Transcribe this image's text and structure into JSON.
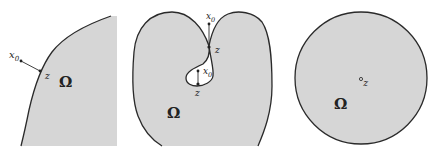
{
  "colors": {
    "fill": "#d6d6d6",
    "stroke": "#2a2a2a",
    "background": "#ffffff"
  },
  "panels": [
    {
      "name": "left-panel",
      "domain_label": "Ω",
      "point_outside": {
        "label": "x",
        "subscript": "0"
      },
      "boundary_point": {
        "label": "z"
      }
    },
    {
      "name": "middle-panel",
      "domain_label": "Ω",
      "points": [
        {
          "label": "x",
          "subscript": "0",
          "role": "exterior-above"
        },
        {
          "label": "z",
          "role": "boundary-neck"
        },
        {
          "label": "x",
          "subscript": "0",
          "role": "in-hole"
        },
        {
          "label": "z",
          "role": "boundary-hole"
        }
      ]
    },
    {
      "name": "right-panel",
      "domain_label": "Ω",
      "interior_point": {
        "label": "z"
      }
    }
  ]
}
